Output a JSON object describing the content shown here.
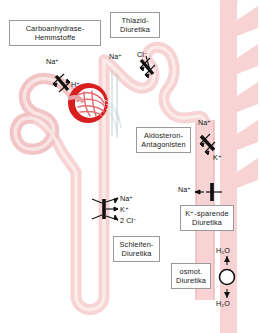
{
  "figure": {
    "colors": {
      "tubule_fill": "#f7d3d3",
      "tubule_stroke": "#e8a3a6",
      "glomerulus_red": "#d81f20",
      "glomerulus_light": "#f3b9bb",
      "duct_fill": "#f7d3d3",
      "vessel_line": "#b9c9cc",
      "symbol_black": "#111111",
      "label_border": "#9a9a9a",
      "background": "#ffffff"
    }
  },
  "labels": [
    {
      "id": "carboanhydrase",
      "line1": "Carboanhydrase-",
      "line2": "Hemmstoffe"
    },
    {
      "id": "thiazid",
      "line1": "Thiazid-",
      "line2": "Diuretika"
    },
    {
      "id": "aldosteron",
      "line1": "Aldosteron-",
      "line2": "Antagonisten"
    },
    {
      "id": "kaliumsparend",
      "line1": "K⁺-sparende",
      "line2": "Diuretika"
    },
    {
      "id": "schleifen",
      "line1": "Schleifen-",
      "line2": "Diuretika"
    },
    {
      "id": "osmotisch",
      "line1": "osmot.",
      "line2": "Diuretika"
    }
  ],
  "ions": {
    "proximal_na": "Na⁺",
    "proximal_h": "H⁺",
    "distal_na": "Na⁺",
    "distal_cl": "Cl⁻",
    "collecting_na": "Na⁺",
    "collecting_k": "K⁺",
    "enac_na": "Na⁺",
    "loop_na": "Na⁺",
    "loop_k": "K⁺",
    "loop_cl": "2 Cl⁻",
    "water_top": "H₂O",
    "water_bottom": "H₂O"
  },
  "transporters": [
    {
      "id": "nhe-exchanger",
      "name": "sodium-hydrogen-exchanger",
      "site": "proximal tubule"
    },
    {
      "id": "ncc-cotransporter",
      "name": "sodium-chloride-cotransporter",
      "site": "distal tubule"
    },
    {
      "id": "nkcc-cotransporter",
      "name": "sodium-potassium-2chloride-cotransporter",
      "site": "loop of Henle"
    },
    {
      "id": "aldosterone-exchanger",
      "name": "sodium-potassium-exchanger",
      "site": "collecting duct"
    },
    {
      "id": "enac-channel",
      "name": "epithelial-sodium-channel",
      "site": "collecting duct"
    },
    {
      "id": "water-channel",
      "name": "aquaporin-water-channel",
      "site": "collecting duct"
    }
  ]
}
